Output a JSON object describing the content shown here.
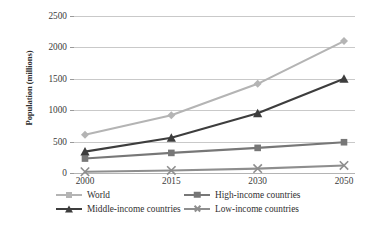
{
  "chart_data": {
    "type": "line",
    "title": "",
    "xlabel": "",
    "ylabel": "Population (millions)",
    "categories": [
      "2000",
      "2015",
      "2030",
      "2050"
    ],
    "x": [
      2000,
      2015,
      2030,
      2050
    ],
    "ylim": [
      0,
      2500
    ],
    "yticks": [
      "0",
      "500",
      "1000",
      "1500",
      "2000",
      "2500"
    ],
    "ytick_values": [
      0,
      500,
      1000,
      1500,
      2000,
      2500
    ],
    "grid": "horizontal",
    "legend_position": "bottom",
    "series": [
      {
        "name": "World",
        "values": [
          610,
          920,
          1420,
          2100
        ],
        "color": "#b4b4b4",
        "marker": "diamond"
      },
      {
        "name": "High-income countries",
        "values": [
          230,
          320,
          400,
          490
        ],
        "color": "#777777",
        "marker": "square"
      },
      {
        "name": "Middle-income countries",
        "values": [
          340,
          560,
          950,
          1500
        ],
        "color": "#3d3d3d",
        "marker": "triangle"
      },
      {
        "name": "Low-income countries",
        "values": [
          20,
          40,
          70,
          120
        ],
        "color": "#8e8e8e",
        "marker": "cross"
      }
    ]
  },
  "axes": {
    "y_title": "Population (millions)",
    "y_ticks": [
      "2500",
      "2000",
      "1500",
      "1000",
      "500",
      "0"
    ],
    "x_ticks": [
      "2000",
      "2015",
      "2030",
      "2050"
    ]
  },
  "legend": {
    "entries": [
      {
        "label": "World",
        "marker": "diamond-marker-icon",
        "color": "#b4b4b4"
      },
      {
        "label": "High-income countries",
        "marker": "square-marker-icon",
        "color": "#777777"
      },
      {
        "label": "Middle-income countries",
        "marker": "triangle-marker-icon",
        "color": "#3d3d3d"
      },
      {
        "label": "Low-income countries",
        "marker": "cross-marker-icon",
        "color": "#8e8e8e"
      }
    ]
  }
}
